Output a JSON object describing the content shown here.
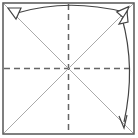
{
  "diagram": {
    "type": "origami-fold-step",
    "colors": {
      "outline": "#555555",
      "dashed_fold": "#666666",
      "diagonal": "#999999",
      "arrow": "#444444",
      "background": "#ffffff"
    },
    "elements": [
      {
        "name": "paper-square",
        "kind": "square outline"
      },
      {
        "name": "valley-fold-vertical",
        "kind": "dashed center line"
      },
      {
        "name": "valley-fold-horizontal",
        "kind": "dashed center line"
      },
      {
        "name": "diagonal-crease-1",
        "kind": "diagonal line"
      },
      {
        "name": "diagonal-crease-2",
        "kind": "diagonal line"
      },
      {
        "name": "fold-arrow-top",
        "kind": "double-headed curved arrow across top"
      },
      {
        "name": "fold-arrow-right",
        "kind": "double-headed curved arrow down right side"
      }
    ]
  }
}
